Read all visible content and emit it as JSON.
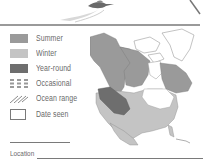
{
  "legend": {
    "items": [
      {
        "label": "Summer",
        "swatch": "solid",
        "color": "#9a9a9a"
      },
      {
        "label": "Winter",
        "swatch": "solid",
        "color": "#c4c4c4"
      },
      {
        "label": "Year-round",
        "swatch": "solid",
        "color": "#6e6e6e"
      },
      {
        "label": "Occasional",
        "swatch": "dashed",
        "color": "#9a9a9a"
      },
      {
        "label": "Ocean range",
        "swatch": "hatch",
        "color": "#8a8a8a"
      },
      {
        "label": "Date seen",
        "swatch": "box",
        "color": "#7a7a7a"
      }
    ]
  },
  "fields": {
    "location_label": "Location"
  },
  "colors": {
    "summer": "#9a9a9a",
    "winter": "#c4c4c4",
    "year_round": "#6e6e6e",
    "rule": "#9a9a9a",
    "text": "#6a6a6a"
  }
}
